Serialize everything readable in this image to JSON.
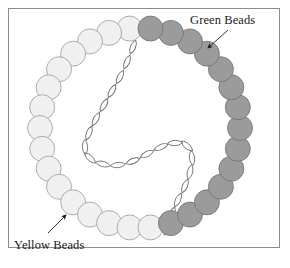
{
  "figure": {
    "type": "diagram",
    "frame": {
      "border_color": "#8d8d8d",
      "background": "#ffffff",
      "x": 8,
      "y": 8,
      "width": 272,
      "height": 240
    },
    "labels": [
      {
        "id": "green",
        "text": "Green Beads",
        "x": 190,
        "y": 13,
        "arrow": {
          "x1": 228,
          "y1": 30,
          "x2": 208,
          "y2": 48
        }
      },
      {
        "id": "yellow",
        "text": "Yellow Beads",
        "x": 14,
        "y": 238,
        "arrow": {
          "x1": 48,
          "y1": 233,
          "x2": 66,
          "y2": 215
        }
      }
    ],
    "necklace": {
      "center_x": 140,
      "center_y": 128,
      "radius": 100,
      "bead_count": 30,
      "bead_radius": 12.5,
      "bead_colors": {
        "yellow_fill": "#f0f0f0",
        "yellow_stroke": "#9a9a9a",
        "green_fill": "#9b9b9b",
        "green_stroke": "#707070"
      },
      "beads": [
        {
          "index": 0,
          "angle": -96,
          "color": "yellow"
        },
        {
          "index": 1,
          "angle": -108,
          "color": "yellow"
        },
        {
          "index": 2,
          "angle": -120,
          "color": "yellow"
        },
        {
          "index": 3,
          "angle": -132,
          "color": "yellow"
        },
        {
          "index": 4,
          "angle": -144,
          "color": "yellow"
        },
        {
          "index": 5,
          "angle": -156,
          "color": "yellow"
        },
        {
          "index": 6,
          "angle": -168,
          "color": "yellow"
        },
        {
          "index": 7,
          "angle": 180,
          "color": "yellow"
        },
        {
          "index": 8,
          "angle": 168,
          "color": "yellow"
        },
        {
          "index": 9,
          "angle": 156,
          "color": "yellow"
        },
        {
          "index": 10,
          "angle": 144,
          "color": "yellow"
        },
        {
          "index": 11,
          "angle": 132,
          "color": "yellow"
        },
        {
          "index": 12,
          "angle": 120,
          "color": "yellow"
        },
        {
          "index": 13,
          "angle": 108,
          "color": "yellow"
        },
        {
          "index": 14,
          "angle": 96,
          "color": "yellow"
        },
        {
          "index": 15,
          "angle": 84,
          "color": "yellow"
        },
        {
          "index": 16,
          "angle": 72,
          "color": "green"
        },
        {
          "index": 17,
          "angle": 60,
          "color": "green"
        },
        {
          "index": 18,
          "angle": 48,
          "color": "green"
        },
        {
          "index": 19,
          "angle": 36,
          "color": "green"
        },
        {
          "index": 20,
          "angle": 24,
          "color": "green"
        },
        {
          "index": 21,
          "angle": 12,
          "color": "green"
        },
        {
          "index": 22,
          "angle": 0,
          "color": "green"
        },
        {
          "index": 23,
          "angle": -12,
          "color": "green"
        },
        {
          "index": 24,
          "angle": -24,
          "color": "green"
        },
        {
          "index": 25,
          "angle": -36,
          "color": "green"
        },
        {
          "index": 26,
          "angle": -48,
          "color": "green"
        },
        {
          "index": 27,
          "angle": -60,
          "color": "green"
        },
        {
          "index": 28,
          "angle": -72,
          "color": "green"
        },
        {
          "index": 29,
          "angle": -84,
          "color": "green"
        }
      ]
    },
    "chain": {
      "stroke": "#6f6f6f",
      "stroke_width": 0.9,
      "fill": "none",
      "link_count": 22,
      "link_length": 15,
      "link_width": 7,
      "path_points": [
        {
          "x": 133,
          "y": 47
        },
        {
          "x": 127,
          "y": 62
        },
        {
          "x": 120,
          "y": 77
        },
        {
          "x": 112,
          "y": 91
        },
        {
          "x": 104,
          "y": 105
        },
        {
          "x": 96,
          "y": 119
        },
        {
          "x": 89,
          "y": 133
        },
        {
          "x": 85,
          "y": 147
        },
        {
          "x": 90,
          "y": 158
        },
        {
          "x": 103,
          "y": 164
        },
        {
          "x": 118,
          "y": 165
        },
        {
          "x": 133,
          "y": 161
        },
        {
          "x": 147,
          "y": 154
        },
        {
          "x": 161,
          "y": 147
        },
        {
          "x": 175,
          "y": 143
        },
        {
          "x": 187,
          "y": 146
        },
        {
          "x": 192,
          "y": 158
        },
        {
          "x": 190,
          "y": 172
        },
        {
          "x": 185,
          "y": 186
        },
        {
          "x": 178,
          "y": 200
        },
        {
          "x": 172,
          "y": 214
        },
        {
          "x": 167,
          "y": 228
        }
      ]
    }
  }
}
